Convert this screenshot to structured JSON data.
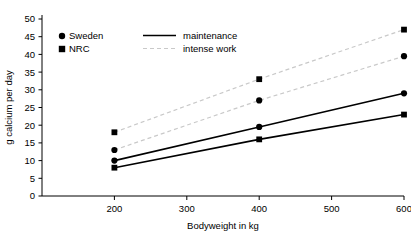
{
  "chart_data": {
    "type": "line",
    "title": "",
    "xlabel": "Bodyweight in kg",
    "ylabel": "g calcium per day",
    "xlim": [
      100,
      600
    ],
    "ylim": [
      0,
      50
    ],
    "x": [
      200,
      400,
      600
    ],
    "xticks": [
      200,
      300,
      400,
      500,
      600
    ],
    "yticks": [
      0,
      5,
      10,
      15,
      20,
      25,
      30,
      35,
      40,
      45,
      50
    ],
    "grid": false,
    "legend_position": "top-left-inside",
    "series": [
      {
        "name": "Sweden maintenance",
        "source": "Sweden",
        "workload": "maintenance",
        "marker": "circle",
        "line": "solid",
        "values": [
          10,
          19.5,
          29
        ]
      },
      {
        "name": "NRC maintenance",
        "source": "NRC",
        "workload": "maintenance",
        "marker": "square",
        "line": "solid",
        "values": [
          8,
          16,
          23
        ]
      },
      {
        "name": "Sweden intense work",
        "source": "Sweden",
        "workload": "intense work",
        "marker": "circle",
        "line": "dashed",
        "values": [
          13,
          27,
          39.5
        ]
      },
      {
        "name": "NRC intense work",
        "source": "NRC",
        "workload": "intense work",
        "marker": "square",
        "line": "dashed",
        "values": [
          18,
          33,
          47
        ]
      }
    ],
    "legend": {
      "markers": [
        {
          "label": "Sweden",
          "glyph": "circle-marker-icon"
        },
        {
          "label": "NRC",
          "glyph": "square-marker-icon"
        }
      ],
      "lines": [
        {
          "label": "maintenance",
          "glyph": "solid-line-icon"
        },
        {
          "label": "intense work",
          "glyph": "dashed-line-icon"
        }
      ]
    },
    "colors": {
      "solid_line": "#000000",
      "dashed_line": "#c9c9c9",
      "marker": "#000000",
      "axis": "#000000",
      "background": "#ffffff"
    }
  }
}
